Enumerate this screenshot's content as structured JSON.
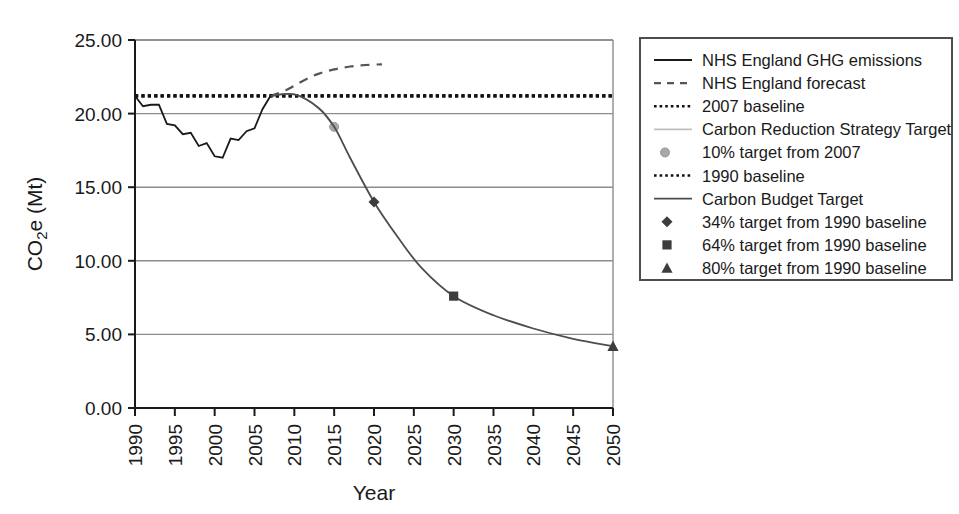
{
  "chart_data": {
    "type": "line",
    "title": "",
    "xlabel": "Year",
    "ylabel": "CO2e (Mt)",
    "ylabel_parts": {
      "pre": "CO",
      "sub": "2",
      "post": "e (Mt)"
    },
    "xlim": [
      1990,
      2050
    ],
    "ylim": [
      0,
      25
    ],
    "x_ticks": [
      1990,
      1995,
      2000,
      2005,
      2010,
      2015,
      2020,
      2025,
      2030,
      2035,
      2040,
      2045,
      2050
    ],
    "x_tick_labels": [
      "1990",
      "1995",
      "2000",
      "2005",
      "2010",
      "2015",
      "2020",
      "2025",
      "2030",
      "2035",
      "2040",
      "2045",
      "2050"
    ],
    "y_ticks": [
      0,
      5,
      10,
      15,
      20,
      25
    ],
    "y_tick_labels": [
      "0.00",
      "5.00",
      "10.00",
      "15.00",
      "20.00",
      "25.00"
    ],
    "grid": "horizontal",
    "legend_position": "right-outside",
    "series": [
      {
        "name": "NHS England GHG emissions",
        "style": "solid",
        "color": "#1a1a1a",
        "x": [
          1990,
          1991,
          1992,
          1993,
          1994,
          1995,
          1996,
          1997,
          1998,
          1999,
          2000,
          2001,
          2002,
          2003,
          2004,
          2005,
          2006,
          2007
        ],
        "values": [
          21.2,
          20.5,
          20.6,
          20.6,
          19.3,
          19.2,
          18.6,
          18.7,
          17.8,
          18.0,
          17.1,
          17.0,
          18.3,
          18.2,
          18.8,
          19.0,
          20.3,
          21.2
        ]
      },
      {
        "name": "NHS England forecast",
        "style": "dashed",
        "color": "#555555",
        "x": [
          2007,
          2009,
          2011,
          2013,
          2015,
          2017,
          2019,
          2021
        ],
        "values": [
          21.2,
          21.6,
          22.2,
          22.7,
          23.0,
          23.2,
          23.3,
          23.35
        ]
      },
      {
        "name": "2007 baseline",
        "style": "dotted",
        "color": "#111111",
        "x": [
          1990,
          2050
        ],
        "values": [
          21.2,
          21.2
        ]
      },
      {
        "name": "Carbon Reduction Strategy Target",
        "style": "solid-light",
        "color": "#bfbfbf",
        "x": [
          2007,
          2010,
          2013,
          2015
        ],
        "values": [
          21.2,
          21.3,
          20.4,
          19.1
        ]
      },
      {
        "name": "10% target from 2007",
        "style": "marker-circle",
        "color": "#a8a8a8",
        "x": [
          2015
        ],
        "values": [
          19.1
        ]
      },
      {
        "name": "1990 baseline",
        "style": "dotted",
        "color": "#111111",
        "x": [
          1990,
          2050
        ],
        "values": [
          21.2,
          21.2
        ]
      },
      {
        "name": "Carbon Budget Target",
        "style": "solid-gray",
        "color": "#4d4d4d",
        "x": [
          2007,
          2010,
          2013,
          2015,
          2017,
          2020,
          2023,
          2026,
          2030,
          2035,
          2040,
          2045,
          2050
        ],
        "values": [
          21.2,
          21.3,
          20.4,
          19.1,
          17.0,
          14.0,
          11.6,
          9.5,
          7.6,
          6.3,
          5.4,
          4.7,
          4.2
        ]
      },
      {
        "name": "34% target from 1990 baseline",
        "style": "marker-diamond",
        "color": "#3d3d3d",
        "x": [
          2020
        ],
        "values": [
          14.0
        ]
      },
      {
        "name": "64% target from 1990 baseline",
        "style": "marker-square",
        "color": "#3d3d3d",
        "x": [
          2030
        ],
        "values": [
          7.6
        ]
      },
      {
        "name": "80% target from 1990 baseline",
        "style": "marker-triangle",
        "color": "#3d3d3d",
        "x": [
          2050
        ],
        "values": [
          4.2
        ]
      }
    ]
  },
  "legend": {
    "items": [
      {
        "label": "NHS England GHG emissions",
        "glyph": "line-solid"
      },
      {
        "label": "NHS England forecast",
        "glyph": "line-dashed"
      },
      {
        "label": "2007 baseline",
        "glyph": "line-dotted"
      },
      {
        "label": "Carbon Reduction Strategy Target",
        "glyph": "line-solid-light"
      },
      {
        "label": "10% target from 2007",
        "glyph": "marker-circle"
      },
      {
        "label": "1990 baseline",
        "glyph": "line-dotted"
      },
      {
        "label": "Carbon Budget Target",
        "glyph": "line-solid-gray"
      },
      {
        "label": "34% target from 1990 baseline",
        "glyph": "marker-diamond"
      },
      {
        "label": "64% target from 1990 baseline",
        "glyph": "marker-square"
      },
      {
        "label": "80% target from 1990 baseline",
        "glyph": "marker-triangle"
      }
    ]
  },
  "axes": {
    "y_title_pre": "CO",
    "y_title_sub": "2",
    "y_title_post": "e (Mt)",
    "x_title": "Year"
  }
}
